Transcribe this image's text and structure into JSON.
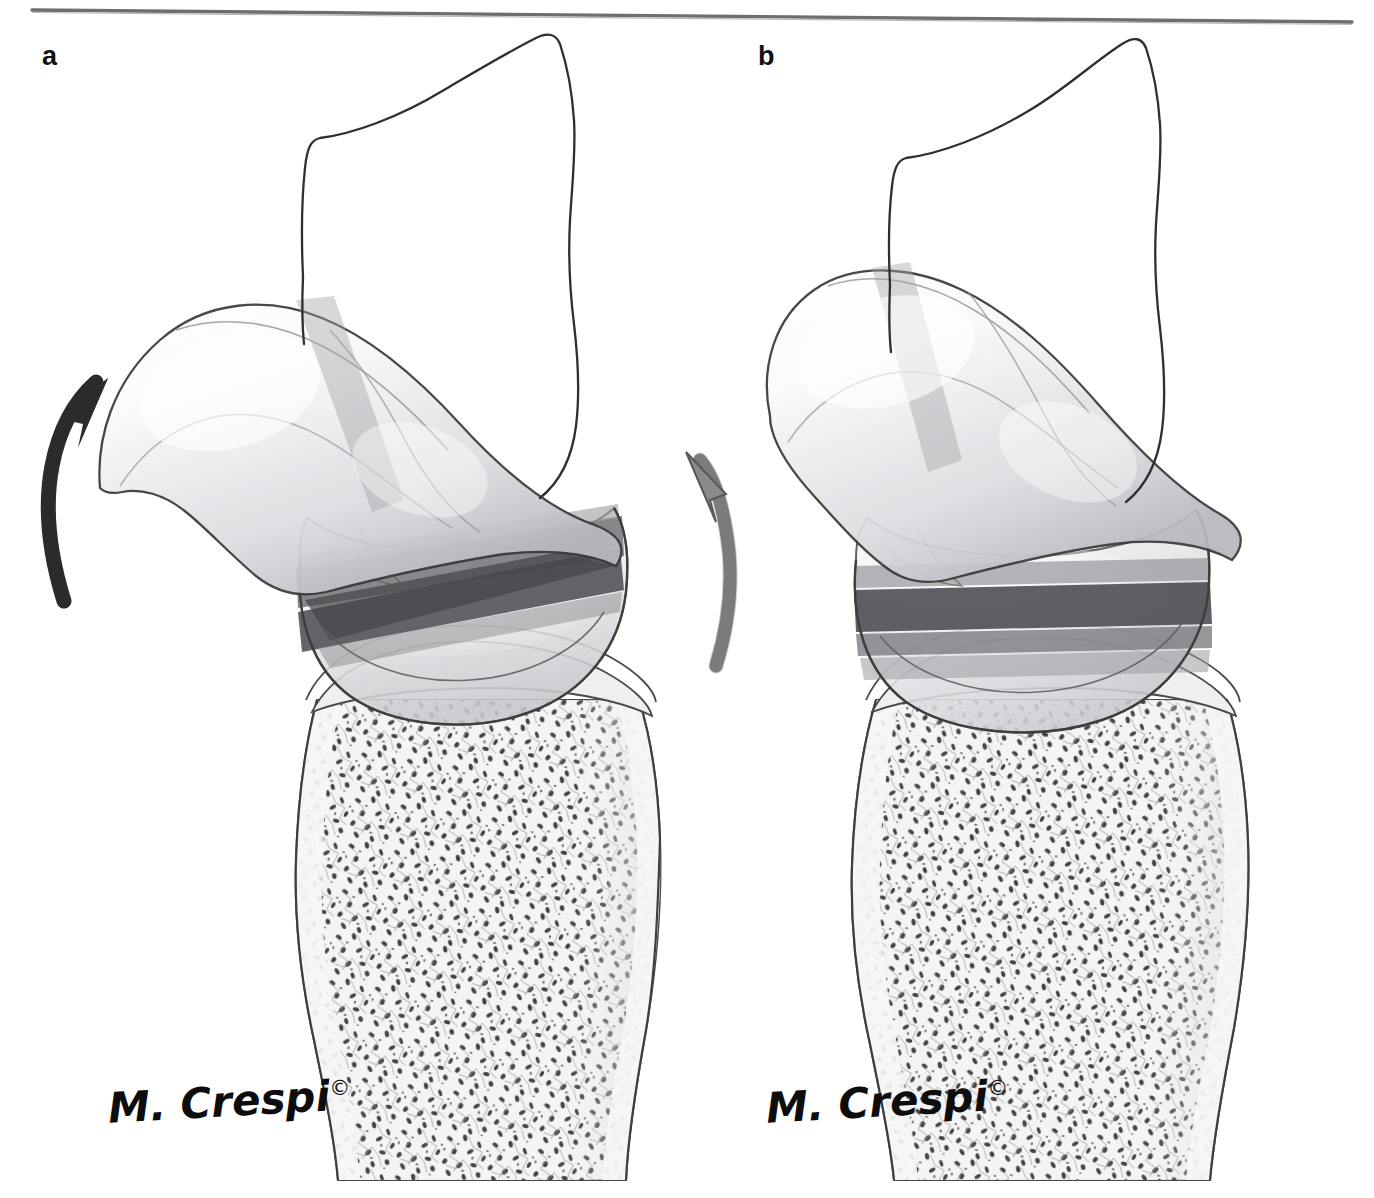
{
  "figure": {
    "type": "anatomical-illustration",
    "background_color": "#ffffff",
    "top_rule_color": "#6e6e6e",
    "outline_color": "#3a3a3a",
    "panels": [
      {
        "id": "a",
        "label": "a",
        "band_configuration": "crossed oblique bands",
        "arrows": [
          {
            "name": "rotation-arrow-dark",
            "color": "#2b2b2b",
            "direction": "up-right"
          },
          {
            "name": "rotation-arrow-gray",
            "color": "#8a8a8a",
            "direction": "up-left"
          }
        ],
        "signature": "M. Crespi",
        "copyright_mark": "©"
      },
      {
        "id": "b",
        "label": "b",
        "band_configuration": "parallel horizontal bands",
        "arrows": [],
        "signature": "M. Crespi",
        "copyright_mark": "©"
      }
    ],
    "colors": {
      "band_dark": "#56565a",
      "band_mid": "#7b7b80",
      "band_light": "#9e9ea3",
      "bone_fill": "#f2f2f2",
      "trabecular_dark": "#3c3c3c",
      "trabecular_mid": "#8c8c8c",
      "cartilage_fill": "#e9e9ec",
      "arrow_dark": "#2b2b2b",
      "arrow_gray": "#8a8a8a"
    }
  }
}
